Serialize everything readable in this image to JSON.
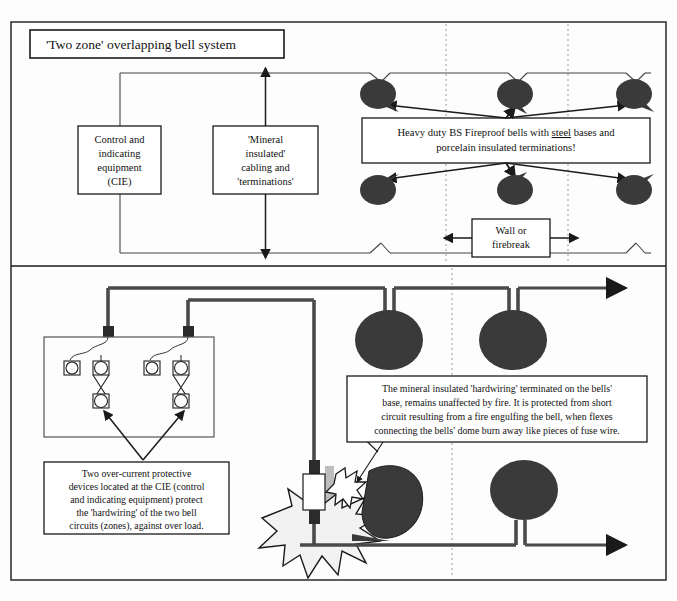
{
  "figure": {
    "title": "'Two zone' overlapping bell system",
    "background_color": "#fdfdfd",
    "line_color": "#1a1a1a",
    "bell_color": "#3a3a3a",
    "wall_color": "#b8b8b8",
    "flame_fill": "#f2f2f2"
  },
  "top_panel": {
    "boxes": {
      "cie": "Control and\nindicating\nequipment\n(CIE)",
      "cie_lines": [
        "Control and",
        "indicating",
        "equipment",
        "(CIE)"
      ],
      "cabling_lines": [
        "'Mineral",
        "insulated'",
        "cabling and",
        "'terminations'"
      ],
      "bells_note_lines_a": "Heavy duty BS Fireproof bells with ",
      "bells_note_underlined": "steel",
      "bells_note_lines_b": " bases and",
      "bells_note_line2": "porcelain insulated terminations!",
      "wall_lines": [
        "Wall or",
        "firebreak"
      ]
    },
    "bells": [
      {
        "id": "top-bell-1",
        "cx": 378,
        "cy": 94,
        "rx": 18,
        "ry": 15
      },
      {
        "id": "top-bell-2",
        "cx": 515,
        "cy": 94,
        "rx": 18,
        "ry": 15
      },
      {
        "id": "top-bell-3",
        "cx": 634,
        "cy": 94,
        "rx": 18,
        "ry": 15
      },
      {
        "id": "bottom-bell-1",
        "cx": 378,
        "cy": 190,
        "rx": 18,
        "ry": 15
      },
      {
        "id": "bottom-bell-2",
        "cx": 515,
        "cy": 190,
        "rx": 18,
        "ry": 15
      },
      {
        "id": "bottom-bell-3",
        "cx": 634,
        "cy": 190,
        "rx": 18,
        "ry": 15
      }
    ],
    "firebreak_dotted_x": [
      446,
      568
    ]
  },
  "bottom_panel": {
    "note_bells_lines": [
      "The mineral insulated 'hardwiring' terminated on the bells'",
      "base, remains unaffected by fire. It is protected from short",
      "circuit resulting from a fire engulfing the bell, when flexes",
      "connecting the bells' dome burn away like pieces of fuse wire."
    ],
    "note_cie_lines": [
      "Two over-current protective",
      "devices located at the CIE (control",
      "and indicating equipment) protect",
      "the 'hardwiring' of the two bell",
      "circuits (zones), against over load."
    ],
    "bells": [
      {
        "id": "lower-bell-1",
        "cx": 389,
        "cy": 340,
        "rx": 34,
        "ry": 30
      },
      {
        "id": "lower-bell-2",
        "cx": 513,
        "cy": 340,
        "rx": 34,
        "ry": 30
      },
      {
        "id": "lower-bell-3",
        "cx": 524,
        "cy": 490,
        "rx": 34,
        "ry": 30
      }
    ],
    "firebreak_dotted_x": [
      452
    ]
  }
}
